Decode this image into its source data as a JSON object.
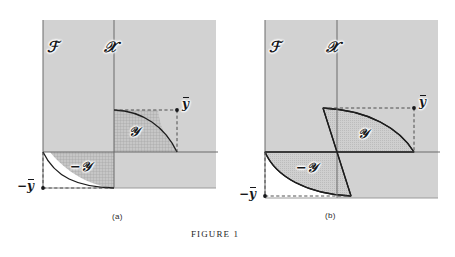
{
  "figure": {
    "label": "FIGURE 1",
    "panels": [
      {
        "id": "a",
        "caption": "(a)",
        "region_labels": {
          "z_space": "ℱ",
          "x_space": "𝒳",
          "y_set": "𝒴",
          "neg_y_set": "−𝒴"
        },
        "points": {
          "y_bar": "y",
          "neg_y_bar": "−y"
        },
        "shape": "comprehensive-set-bounded-by-concave-curve"
      },
      {
        "id": "b",
        "caption": "(b)",
        "region_labels": {
          "z_space": "ℱ",
          "x_space": "𝒳",
          "y_set": "𝒴",
          "neg_y_set": "−𝒴"
        },
        "points": {
          "y_bar": "y",
          "neg_y_bar": "−y"
        },
        "shape": "lens-shaped-set-through-origin"
      }
    ]
  },
  "colors": {
    "page_background": "#ffffff",
    "panel_fill": "#d2d2d2",
    "hatch_fill": "#c2c2c2",
    "lens_fill": "#c9c9c9",
    "axis_stroke": "#6a6a6a",
    "curve_stroke": "#1d1d1d",
    "dash_stroke": "#4a4a4a",
    "text": "#16171a"
  }
}
